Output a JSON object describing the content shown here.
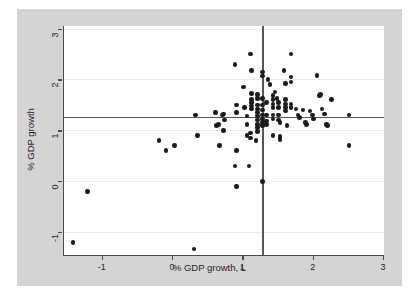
{
  "chart_data": {
    "type": "scatter",
    "title": "",
    "xlabel": "% GDP growth, L",
    "ylabel": "% GDP growth",
    "xlim": [
      -1.55,
      3.0
    ],
    "ylim": [
      -1.45,
      3.05
    ],
    "xticks": [
      -1,
      0,
      1,
      2,
      3
    ],
    "xticklabels": [
      "-1",
      "0",
      "1",
      "2",
      "3"
    ],
    "yticks": [
      -1,
      0,
      1,
      2,
      3
    ],
    "yticklabels": [
      "-1",
      "0",
      "1",
      "2",
      "3"
    ],
    "grid": true,
    "grid_axis": "y",
    "legend": null,
    "marker": "filled-circle",
    "marker_color": "#1b1b1b",
    "background_color": "#d4d4d4",
    "plot_background_color": "#ffffff",
    "gridline_color": "#ebebeb",
    "axis_color": "#4a4a57",
    "reference_lines": [
      {
        "orientation": "horizontal",
        "value": 1.27,
        "color": "#55555f"
      },
      {
        "orientation": "vertical",
        "value": 1.27,
        "color": "#55555f"
      }
    ],
    "points": [
      [
        -1.42,
        -1.2
      ],
      [
        -1.22,
        -0.2
      ],
      [
        0.3,
        -1.33
      ],
      [
        -0.2,
        0.8
      ],
      [
        -0.1,
        0.6
      ],
      [
        0.02,
        0.7
      ],
      [
        0.32,
        1.3
      ],
      [
        0.35,
        0.9
      ],
      [
        0.6,
        1.35
      ],
      [
        0.62,
        1.1
      ],
      [
        0.65,
        1.12
      ],
      [
        0.7,
        1.3
      ],
      [
        0.72,
        1.32
      ],
      [
        0.73,
        1.2
      ],
      [
        0.66,
        0.7
      ],
      [
        0.72,
        1.0
      ],
      [
        0.88,
        2.29
      ],
      [
        0.9,
        1.5
      ],
      [
        0.9,
        1.35
      ],
      [
        0.88,
        0.3
      ],
      [
        0.9,
        0.6
      ],
      [
        0.9,
        -0.1
      ],
      [
        1.0,
        1.85
      ],
      [
        1.02,
        1.45
      ],
      [
        1.05,
        1.28
      ],
      [
        1.05,
        1.12
      ],
      [
        1.05,
        0.9
      ],
      [
        1.08,
        0.3
      ],
      [
        1.1,
        2.5
      ],
      [
        1.12,
        2.18
      ],
      [
        1.12,
        1.72
      ],
      [
        1.12,
        1.6
      ],
      [
        1.12,
        1.55
      ],
      [
        1.12,
        1.48
      ],
      [
        1.12,
        1.42
      ],
      [
        1.1,
        0.95
      ],
      [
        1.1,
        0.85
      ],
      [
        1.2,
        1.7
      ],
      [
        1.2,
        1.62
      ],
      [
        1.2,
        1.5
      ],
      [
        1.2,
        1.42
      ],
      [
        1.2,
        1.35
      ],
      [
        1.2,
        1.28
      ],
      [
        1.2,
        1.2
      ],
      [
        1.2,
        1.12
      ],
      [
        1.2,
        1.05
      ],
      [
        1.2,
        0.98
      ],
      [
        1.18,
        0.8
      ],
      [
        1.27,
        2.15
      ],
      [
        1.27,
        2.07
      ],
      [
        1.27,
        1.62
      ],
      [
        1.27,
        1.5
      ],
      [
        1.27,
        1.4
      ],
      [
        1.27,
        1.3
      ],
      [
        1.27,
        1.22
      ],
      [
        1.27,
        1.15
      ],
      [
        1.27,
        1.1
      ],
      [
        1.27,
        0.0
      ],
      [
        1.33,
        1.55
      ],
      [
        1.33,
        1.3
      ],
      [
        1.33,
        1.18
      ],
      [
        1.33,
        1.12
      ],
      [
        1.35,
        2.0
      ],
      [
        1.38,
        1.9
      ],
      [
        1.42,
        1.68
      ],
      [
        1.42,
        1.6
      ],
      [
        1.42,
        1.52
      ],
      [
        1.42,
        1.45
      ],
      [
        1.42,
        1.3
      ],
      [
        1.42,
        1.22
      ],
      [
        1.42,
        0.9
      ],
      [
        1.45,
        1.75
      ],
      [
        1.48,
        1.62
      ],
      [
        1.5,
        1.55
      ],
      [
        1.5,
        1.45
      ],
      [
        1.5,
        1.3
      ],
      [
        1.5,
        1.2
      ],
      [
        1.52,
        1.15
      ],
      [
        1.52,
        0.88
      ],
      [
        1.52,
        0.82
      ],
      [
        1.58,
        2.18
      ],
      [
        1.6,
        1.92
      ],
      [
        1.6,
        1.6
      ],
      [
        1.6,
        1.52
      ],
      [
        1.6,
        1.45
      ],
      [
        1.6,
        1.38
      ],
      [
        1.62,
        1.1
      ],
      [
        1.68,
        2.5
      ],
      [
        1.68,
        2.05
      ],
      [
        1.68,
        1.95
      ],
      [
        1.68,
        1.52
      ],
      [
        1.68,
        1.45
      ],
      [
        1.75,
        1.42
      ],
      [
        1.78,
        1.3
      ],
      [
        1.8,
        1.25
      ],
      [
        1.85,
        1.4
      ],
      [
        1.88,
        1.15
      ],
      [
        1.9,
        1.12
      ],
      [
        1.95,
        1.38
      ],
      [
        1.98,
        1.3
      ],
      [
        2.0,
        1.22
      ],
      [
        2.05,
        2.08
      ],
      [
        2.08,
        1.68
      ],
      [
        2.1,
        1.7
      ],
      [
        2.12,
        1.42
      ],
      [
        2.15,
        1.32
      ],
      [
        2.18,
        1.12
      ],
      [
        2.25,
        1.6
      ],
      [
        2.2,
        1.1
      ],
      [
        2.5,
        1.3
      ],
      [
        2.5,
        0.7
      ]
    ]
  }
}
